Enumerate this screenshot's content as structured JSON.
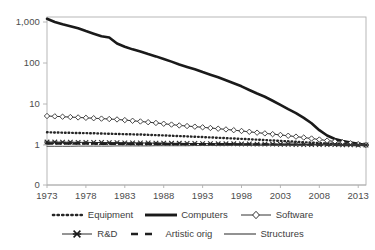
{
  "chart_data": {
    "type": "line",
    "title": "",
    "subtitle": "",
    "xlabel": "",
    "ylabel": "",
    "yscale": "log",
    "grid": false,
    "legend_position": "bottom",
    "xlim": [
      1973,
      2014
    ],
    "ylim": [
      1,
      2000
    ],
    "ytick_labels": [
      "1,000",
      "100",
      "10",
      "1",
      "0"
    ],
    "ytick_values": [
      1000,
      100,
      10,
      1,
      0
    ],
    "xtick_labels": [
      "1973",
      "1978",
      "1983",
      "1988",
      "1993",
      "1998",
      "2003",
      "2008",
      "2013"
    ],
    "xtick_values": [
      1973,
      1978,
      1983,
      1988,
      1993,
      1998,
      2003,
      2008,
      2013
    ],
    "x": [
      1973,
      1974,
      1975,
      1976,
      1977,
      1978,
      1979,
      1980,
      1981,
      1982,
      1983,
      1984,
      1985,
      1986,
      1987,
      1988,
      1989,
      1990,
      1991,
      1992,
      1993,
      1994,
      1995,
      1996,
      1997,
      1998,
      1999,
      2000,
      2001,
      2002,
      2003,
      2004,
      2005,
      2006,
      2007,
      2008,
      2009,
      2010,
      2011,
      2012,
      2013,
      2014
    ],
    "series": [
      {
        "name": "Equipment",
        "style": "dotted",
        "marker": "none",
        "color": "#262626",
        "values": [
          2.05,
          2.02,
          2.0,
          1.98,
          1.96,
          1.95,
          1.93,
          1.9,
          1.88,
          1.86,
          1.84,
          1.82,
          1.8,
          1.77,
          1.74,
          1.71,
          1.68,
          1.65,
          1.62,
          1.59,
          1.56,
          1.53,
          1.5,
          1.47,
          1.44,
          1.41,
          1.38,
          1.35,
          1.32,
          1.29,
          1.26,
          1.23,
          1.2,
          1.17,
          1.14,
          1.11,
          1.09,
          1.07,
          1.05,
          1.03,
          1.01,
          1.0
        ]
      },
      {
        "name": "Computers",
        "style": "solid-thick",
        "marker": "none",
        "color": "#1a1a1a",
        "values": [
          1200,
          1000,
          880,
          790,
          700,
          600,
          520,
          450,
          420,
          300,
          250,
          215,
          190,
          165,
          145,
          125,
          108,
          92,
          80,
          70,
          60,
          52,
          45,
          38,
          32,
          27,
          22,
          18,
          15,
          12,
          9.5,
          7.5,
          6.0,
          4.6,
          3.4,
          2.3,
          1.7,
          1.4,
          1.25,
          1.15,
          1.07,
          1.0
        ]
      },
      {
        "name": "Software",
        "style": "solid-thin",
        "marker": "diamond",
        "color": "#333333",
        "values": [
          5.1,
          5.0,
          4.9,
          4.8,
          4.7,
          4.6,
          4.5,
          4.4,
          4.3,
          4.2,
          4.05,
          3.9,
          3.75,
          3.6,
          3.45,
          3.3,
          3.15,
          3.0,
          2.9,
          2.8,
          2.7,
          2.6,
          2.5,
          2.4,
          2.3,
          2.2,
          2.1,
          2.0,
          1.92,
          1.84,
          1.76,
          1.68,
          1.6,
          1.52,
          1.44,
          1.36,
          1.28,
          1.22,
          1.16,
          1.1,
          1.05,
          1.0
        ]
      },
      {
        "name": "R&D",
        "style": "solid-thin",
        "marker": "x",
        "color": "#2b2b2b",
        "values": [
          1.18,
          1.18,
          1.17,
          1.17,
          1.16,
          1.16,
          1.15,
          1.15,
          1.14,
          1.14,
          1.13,
          1.13,
          1.12,
          1.12,
          1.11,
          1.11,
          1.1,
          1.1,
          1.09,
          1.09,
          1.08,
          1.08,
          1.07,
          1.07,
          1.07,
          1.06,
          1.06,
          1.05,
          1.05,
          1.05,
          1.04,
          1.04,
          1.03,
          1.03,
          1.03,
          1.02,
          1.02,
          1.02,
          1.01,
          1.01,
          1.0,
          1.0
        ]
      },
      {
        "name": "Artistic orig",
        "style": "dashed",
        "marker": "none",
        "color": "#1f1f1f",
        "values": [
          1.09,
          1.09,
          1.09,
          1.08,
          1.08,
          1.08,
          1.08,
          1.07,
          1.07,
          1.07,
          1.07,
          1.06,
          1.06,
          1.06,
          1.06,
          1.05,
          1.05,
          1.05,
          1.05,
          1.05,
          1.04,
          1.04,
          1.04,
          1.04,
          1.04,
          1.03,
          1.03,
          1.03,
          1.03,
          1.02,
          1.02,
          1.02,
          1.02,
          1.02,
          1.01,
          1.01,
          1.01,
          1.01,
          1.0,
          1.0,
          1.0,
          1.0
        ]
      },
      {
        "name": "Structures",
        "style": "solid-thin",
        "marker": "none",
        "color": "#4a4a4a",
        "values": [
          0.93,
          0.93,
          0.93,
          0.93,
          0.94,
          0.94,
          0.94,
          0.94,
          0.94,
          0.95,
          0.95,
          0.95,
          0.95,
          0.95,
          0.96,
          0.96,
          0.96,
          0.96,
          0.96,
          0.97,
          0.97,
          0.97,
          0.97,
          0.97,
          0.98,
          0.98,
          0.98,
          0.98,
          0.98,
          0.99,
          0.99,
          0.99,
          0.99,
          0.99,
          0.99,
          1.0,
          1.0,
          1.0,
          1.0,
          1.0,
          1.0,
          1.0
        ]
      }
    ]
  },
  "legend": {
    "items": [
      {
        "label": "Equipment",
        "key": "dotted-key"
      },
      {
        "label": "Computers",
        "key": "thick-solid-key"
      },
      {
        "label": "Software",
        "key": "diamond-marker-key"
      },
      {
        "label": "R&D",
        "key": "x-marker-key"
      },
      {
        "label": "Artistic orig",
        "key": "dashed-key"
      },
      {
        "label": "Structures",
        "key": "thin-solid-key"
      }
    ]
  },
  "colors": {
    "plot_border": "#b0b0b0",
    "axis_text": "#4d4d4d",
    "background": "#ffffff"
  }
}
